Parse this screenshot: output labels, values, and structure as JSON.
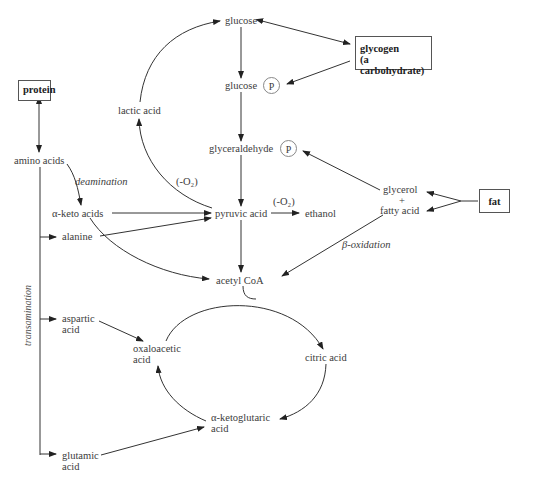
{
  "diagram": {
    "nodes": {
      "glucose": "glucose",
      "glucose_p": "glucose",
      "phosphate": "P",
      "glycogen_line1": "glycogen",
      "glycogen_line2": "(a carbohydrate)",
      "protein": "protein",
      "lactic_acid": "lactic acid",
      "glyceraldehyde_p": "glyceraldehyde",
      "amino_acids": "amino acids",
      "glycerol": "glycerol",
      "plus": "+",
      "fatty_acid": "fatty acid",
      "fat": "fat",
      "alpha_keto_acids": "α-keto acids",
      "pyruvic_acid": "pyruvic acid",
      "ethanol": "ethanol",
      "alanine": "alanine",
      "acetyl_coa": "acetyl CoA",
      "aspartic_acid_line1": "aspartic",
      "aspartic_acid_line2": "acid",
      "oxaloacetic_acid_line1": "oxaloacetic",
      "oxaloacetic_acid_line2": "acid",
      "citric_acid": "citric acid",
      "alpha_ketoglutaric_line1": "α-ketoglutaric",
      "alpha_ketoglutaric_line2": "acid",
      "glutamic_acid_line1": "glutamic",
      "glutamic_acid_line2": "acid"
    },
    "process_labels": {
      "deamination": "deamination",
      "anaerobic_lactic": "(-O₂)",
      "anaerobic_ethanol": "(-O₂)",
      "beta_oxidation": "β-oxidation",
      "transamination": "transamination"
    },
    "colors": {
      "line": "#333333",
      "text": "#3c3c3c",
      "box_border": "#555555"
    }
  }
}
